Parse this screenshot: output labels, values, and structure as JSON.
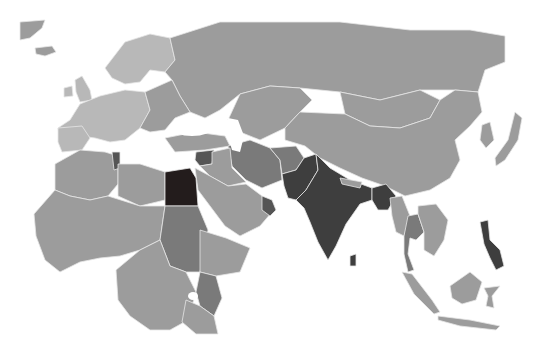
{
  "map": {
    "type": "choropleth",
    "region": "Europe, Africa, Asia",
    "background": "#ffffff",
    "border_color": "#e6e6e6",
    "shades": {
      "light": "#b8b8b8",
      "base": "#9c9c9c",
      "medium": "#7a7a7a",
      "dark": "#555555",
      "darker": "#3e3e3e",
      "darkest": "#231c1c"
    },
    "countries": [
      {
        "name": "Russia",
        "shade": "base"
      },
      {
        "name": "China",
        "shade": "base"
      },
      {
        "name": "Mongolia",
        "shade": "base"
      },
      {
        "name": "Kazakhstan",
        "shade": "base"
      },
      {
        "name": "Western Europe",
        "shade": "light"
      },
      {
        "name": "Scandinavia",
        "shade": "light"
      },
      {
        "name": "Eastern Europe",
        "shade": "base"
      },
      {
        "name": "Turkey",
        "shade": "base"
      },
      {
        "name": "Iran",
        "shade": "medium"
      },
      {
        "name": "Saudi Arabia",
        "shade": "base"
      },
      {
        "name": "Syria",
        "shade": "dark"
      },
      {
        "name": "Egypt",
        "shade": "darkest"
      },
      {
        "name": "Tunisia",
        "shade": "dark"
      },
      {
        "name": "Sudan",
        "shade": "medium"
      },
      {
        "name": "Kenya",
        "shade": "medium"
      },
      {
        "name": "Pakistan",
        "shade": "darker"
      },
      {
        "name": "India",
        "shade": "darker"
      },
      {
        "name": "Bangladesh",
        "shade": "darker"
      },
      {
        "name": "Sri Lanka",
        "shade": "darker"
      },
      {
        "name": "Thailand",
        "shade": "medium"
      },
      {
        "name": "Philippines",
        "shade": "darker"
      },
      {
        "name": "Indonesia",
        "shade": "base"
      },
      {
        "name": "Oman/UAE",
        "shade": "dark"
      }
    ]
  }
}
